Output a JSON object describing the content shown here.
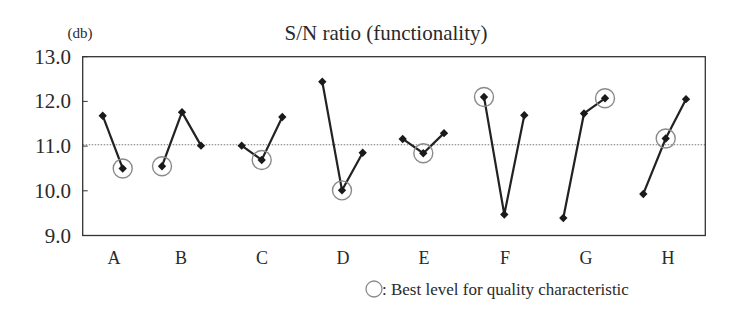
{
  "chart_data": {
    "type": "line",
    "title": "S/N ratio (functionality)",
    "ylabel": "(db)",
    "xlabel": "",
    "ylim": [
      9.0,
      13.0
    ],
    "yticks": [
      "13.0",
      "12.0",
      "11.0",
      "10.0",
      "9.0"
    ],
    "ytick_values": [
      13.0,
      12.0,
      11.0,
      10.0,
      9.0
    ],
    "grid": false,
    "reference_line": {
      "value": 11.03,
      "style": "dotted",
      "label": ""
    },
    "categories": [
      "A",
      "B",
      "C",
      "D",
      "E",
      "F",
      "G",
      "H"
    ],
    "factors": [
      {
        "name": "A",
        "levels": [
          11.68,
          10.5
        ],
        "best_level_index": 1
      },
      {
        "name": "B",
        "levels": [
          10.55,
          11.76,
          11.01
        ],
        "best_level_index": 0
      },
      {
        "name": "C",
        "levels": [
          11.01,
          10.69,
          11.65
        ],
        "best_level_index": 1
      },
      {
        "name": "D",
        "levels": [
          12.44,
          10.01,
          10.85
        ],
        "best_level_index": 1
      },
      {
        "name": "E",
        "levels": [
          11.16,
          10.84,
          11.29
        ],
        "best_level_index": 1
      },
      {
        "name": "F",
        "levels": [
          12.1,
          9.47,
          11.69
        ],
        "best_level_index": 0
      },
      {
        "name": "G",
        "levels": [
          9.39,
          11.73,
          12.07
        ],
        "best_level_index": 2
      },
      {
        "name": "H",
        "levels": [
          9.93,
          11.17,
          12.05
        ],
        "best_level_index": 1
      }
    ],
    "legend": {
      "position": "bottom-right",
      "entries": [
        {
          "symbol": "circle",
          "label": ": Best level for quality characteristic"
        }
      ]
    }
  },
  "layout": {
    "plot": {
      "left": 82.7,
      "right": 705.3,
      "top": 56.7,
      "bottom": 235.5
    },
    "factor_x": [
      [
        102.7,
        122.7
      ],
      [
        162.0,
        182.0,
        201.0
      ],
      [
        241.7,
        261.7,
        282.3
      ],
      [
        322.3,
        342.0,
        362.7
      ],
      [
        402.7,
        423.3,
        444.0
      ],
      [
        484.0,
        504.3,
        524.3
      ],
      [
        563.3,
        584.0,
        605.0
      ],
      [
        643.3,
        665.7,
        686.0
      ]
    ],
    "label_x": [
      114,
      181,
      262,
      343,
      424,
      505,
      586,
      668
    ]
  },
  "colors": {
    "line": "#222222",
    "marker": "#1a1a1a",
    "best_circle": "#8a8a8a",
    "axis": "#333333",
    "reference": "#777777",
    "text": "#2a2a2a"
  }
}
